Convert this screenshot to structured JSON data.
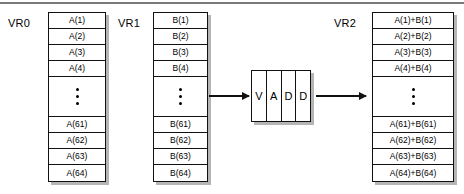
{
  "diagram": {
    "colors": {
      "background": "#ffffff",
      "stroke": "#111111",
      "shadow": "#787878",
      "rule": "#7a7a7a"
    },
    "top_rule": true,
    "registers": [
      {
        "label": "VR0",
        "cells": [
          "A(1)",
          "A(2)",
          "A(3)",
          "A(4)"
        ],
        "ellipsis": "⋮",
        "cells_tail": [
          "A(61)",
          "A(62)",
          "A(63)",
          "A(64)"
        ]
      },
      {
        "label": "VR1",
        "cells": [
          "B(1)",
          "B(2)",
          "B(3)",
          "B(4)"
        ],
        "ellipsis": "⋮",
        "cells_tail": [
          "B(61)",
          "B(62)",
          "B(63)",
          "B(64)"
        ]
      },
      {
        "label": "VR2",
        "cells": [
          "A(1)+B(1)",
          "A(2)+B(2)",
          "A(3)+B(3)",
          "A(4)+B(4)"
        ],
        "ellipsis": "⋮",
        "cells_tail": [
          "A(61)+B(61)",
          "A(62)+B(62)",
          "A(63)+B(63)",
          "A(64)+B(64)"
        ]
      }
    ],
    "unit": {
      "name": "VADD",
      "cells": [
        "V",
        "A",
        "D",
        "D"
      ]
    },
    "arrows": [
      {
        "name": "operands-to-unit"
      },
      {
        "name": "unit-to-result"
      }
    ]
  }
}
